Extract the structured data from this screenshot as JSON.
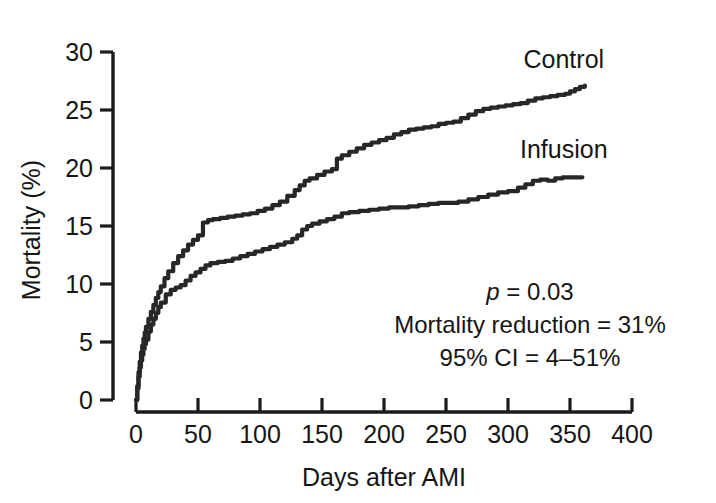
{
  "chart_data": {
    "type": "line",
    "subtype": "kaplan-meier-step",
    "title": "",
    "xlabel": "Days after AMI",
    "ylabel": "Mortality (%)",
    "xlim": [
      0,
      400
    ],
    "ylim": [
      0,
      30
    ],
    "xticks": [
      0,
      50,
      100,
      150,
      200,
      250,
      300,
      350,
      400
    ],
    "xtick_labels": [
      "0",
      "50",
      "100",
      "150",
      "200",
      "250",
      "300",
      "350",
      "400"
    ],
    "yticks": [
      0,
      5,
      10,
      15,
      20,
      25,
      30
    ],
    "ytick_labels": [
      "0",
      "5",
      "10",
      "15",
      "20",
      "25",
      "30"
    ],
    "grid": false,
    "legend_position": "inline-right",
    "line_color": "#272727",
    "series": [
      {
        "name": "Control",
        "label": "Control",
        "label_x": 345,
        "label_y": 28.6,
        "end_value": 27.1,
        "x": [
          0,
          1,
          2,
          3,
          4,
          5,
          6,
          7,
          8,
          10,
          12,
          14,
          16,
          18,
          20,
          23,
          26,
          30,
          34,
          38,
          42,
          46,
          50,
          54,
          58,
          62,
          68,
          74,
          80,
          86,
          92,
          98,
          104,
          110,
          116,
          122,
          128,
          132,
          136,
          140,
          146,
          152,
          158,
          162,
          166,
          172,
          178,
          184,
          190,
          196,
          202,
          208,
          214,
          220,
          226,
          232,
          238,
          244,
          250,
          256,
          262,
          268,
          274,
          280,
          286,
          292,
          298,
          304,
          310,
          316,
          322,
          328,
          334,
          340,
          346,
          350,
          354,
          358,
          362
        ],
        "y": [
          0.0,
          1.2,
          2.4,
          3.3,
          4.1,
          4.7,
          5.3,
          5.8,
          6.3,
          7.0,
          7.6,
          8.2,
          8.8,
          9.3,
          9.8,
          10.5,
          11.1,
          11.8,
          12.4,
          12.9,
          13.4,
          13.8,
          14.2,
          15.3,
          15.5,
          15.6,
          15.7,
          15.8,
          15.9,
          16.0,
          16.1,
          16.3,
          16.5,
          16.8,
          17.1,
          17.6,
          18.1,
          18.5,
          18.9,
          19.1,
          19.4,
          19.7,
          19.9,
          20.8,
          21.1,
          21.4,
          21.7,
          22.0,
          22.2,
          22.4,
          22.6,
          22.9,
          23.1,
          23.3,
          23.4,
          23.5,
          23.6,
          23.8,
          23.9,
          24.0,
          24.3,
          24.6,
          24.9,
          25.1,
          25.2,
          25.3,
          25.4,
          25.5,
          25.6,
          25.8,
          26.0,
          26.1,
          26.2,
          26.3,
          26.4,
          26.6,
          26.8,
          27.0,
          27.1
        ]
      },
      {
        "name": "Infusion",
        "label": "Infusion",
        "label_x": 345,
        "label_y": 20.9,
        "end_value": 19.2,
        "x": [
          0,
          1,
          2,
          3,
          4,
          5,
          6,
          7,
          8,
          10,
          12,
          14,
          16,
          18,
          20,
          24,
          28,
          32,
          36,
          40,
          44,
          48,
          52,
          56,
          60,
          66,
          72,
          78,
          84,
          90,
          96,
          102,
          108,
          114,
          120,
          126,
          130,
          134,
          138,
          142,
          148,
          154,
          160,
          166,
          172,
          180,
          188,
          196,
          204,
          212,
          220,
          228,
          236,
          244,
          252,
          260,
          268,
          276,
          284,
          292,
          300,
          308,
          314,
          320,
          326,
          332,
          338,
          344,
          350,
          356,
          360
        ],
        "y": [
          0.0,
          1.0,
          2.0,
          2.8,
          3.4,
          3.9,
          4.4,
          4.8,
          5.2,
          5.9,
          6.5,
          7.0,
          7.5,
          8.0,
          8.4,
          9.1,
          9.5,
          9.7,
          9.9,
          10.3,
          10.7,
          11.0,
          11.3,
          11.6,
          11.8,
          11.9,
          12.0,
          12.2,
          12.4,
          12.6,
          12.8,
          13.0,
          13.2,
          13.4,
          13.6,
          13.9,
          14.2,
          14.7,
          15.0,
          15.2,
          15.4,
          15.6,
          15.8,
          16.1,
          16.2,
          16.3,
          16.4,
          16.5,
          16.6,
          16.6,
          16.7,
          16.8,
          16.9,
          17.0,
          17.0,
          17.1,
          17.3,
          17.5,
          17.7,
          17.9,
          18.0,
          18.3,
          18.6,
          18.9,
          19.0,
          18.9,
          19.1,
          19.2,
          19.2,
          19.2,
          19.2
        ]
      }
    ],
    "annotations": [
      {
        "id": "p-value",
        "text_italic": "p",
        "text": " = 0.03"
      },
      {
        "id": "mortality-reduction",
        "text": "Mortality reduction = 31%"
      },
      {
        "id": "confidence-interval",
        "text": "95% CI = 4–51%"
      }
    ]
  }
}
